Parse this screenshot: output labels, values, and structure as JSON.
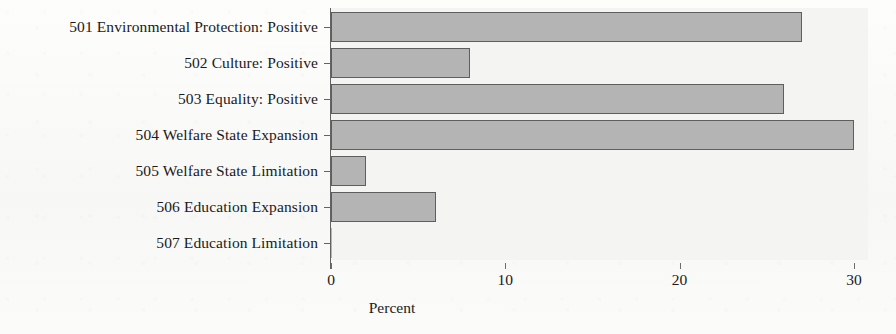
{
  "chart_data": {
    "type": "bar",
    "orientation": "horizontal",
    "title": "",
    "xlabel": "Percent",
    "ylabel": "",
    "categories": [
      "501 Environmental Protection: Positive",
      "502 Culture: Positive",
      "503 Equality: Positive",
      "504 Welfare State Expansion",
      "505 Welfare State Limitation",
      "506 Education Expansion",
      "507 Education Limitation"
    ],
    "values": [
      27,
      8,
      26,
      30,
      2,
      6,
      0
    ],
    "xlim": [
      0,
      30.8
    ],
    "xticks": [
      0,
      10,
      20,
      30
    ],
    "xtick_labels": [
      "0",
      "10",
      "20",
      "30"
    ],
    "grid": false,
    "legend": false,
    "bar_color": "#b4b4b4",
    "bar_edge_color": "#5e5e5e",
    "plot_background": "#f4f4f3",
    "figure_background": "#fbfbfa"
  }
}
